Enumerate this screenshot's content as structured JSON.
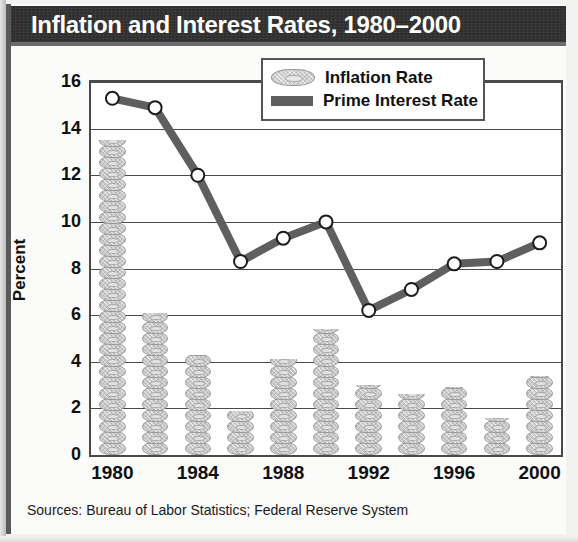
{
  "title": "Inflation and Interest Rates, 1980–2000",
  "source_note": "Sources: Bureau of Labor Statistics; Federal Reserve System",
  "legend": {
    "items": [
      {
        "label": "Inflation Rate",
        "swatch": "bill-icon",
        "color": "#c9c9c9"
      },
      {
        "label": "Prime Interest Rate",
        "swatch": "line-swatch-icon",
        "color": "#5f5f5f"
      }
    ]
  },
  "chart_data": {
    "type": "bar",
    "title": "Inflation and Interest Rates, 1980–2000",
    "xlabel": "",
    "ylabel": "Percent",
    "ylim": [
      0,
      16
    ],
    "ytick_step": 2,
    "yticks": [
      "0",
      "2",
      "4",
      "6",
      "8",
      "10",
      "12",
      "14",
      "16"
    ],
    "grid": true,
    "legend_position": "top-right",
    "categories": [
      1980,
      1982,
      1984,
      1986,
      1988,
      1990,
      1992,
      1994,
      1996,
      1998,
      2000
    ],
    "xtick_labels": [
      "1980",
      "1984",
      "1988",
      "1992",
      "1996",
      "2000"
    ],
    "xtick_values": [
      1980,
      1984,
      1988,
      1992,
      1996,
      2000
    ],
    "series": [
      {
        "name": "Inflation Rate",
        "kind": "bar",
        "color": "#c9c9c9",
        "values": [
          13.5,
          6.1,
          4.3,
          1.9,
          4.1,
          5.4,
          3.0,
          2.6,
          2.9,
          1.6,
          3.4
        ]
      },
      {
        "name": "Prime Interest Rate",
        "kind": "line",
        "color": "#5f5f5f",
        "values": [
          15.3,
          14.9,
          12.0,
          8.3,
          9.3,
          10.0,
          6.2,
          7.1,
          8.2,
          8.3,
          9.1
        ]
      }
    ]
  }
}
